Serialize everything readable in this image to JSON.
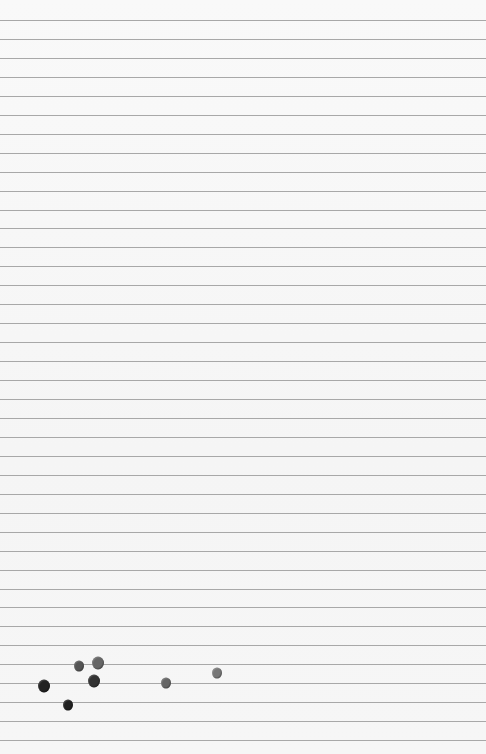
{
  "paper": {
    "width": 486,
    "height": 754,
    "background": "#f7f7f7",
    "line_color": "#9a9a9a",
    "first_line_y": 20,
    "line_spacing": 18.95,
    "line_count": 39
  },
  "dots": [
    {
      "x": 79,
      "y": 666,
      "r": 5,
      "color": "#555555"
    },
    {
      "x": 98,
      "y": 663,
      "r": 6,
      "color": "#666666"
    },
    {
      "x": 44,
      "y": 686,
      "r": 6,
      "color": "#222222"
    },
    {
      "x": 94,
      "y": 681,
      "r": 6,
      "color": "#333333"
    },
    {
      "x": 68,
      "y": 705,
      "r": 5,
      "color": "#222222"
    },
    {
      "x": 166,
      "y": 683,
      "r": 5,
      "color": "#666666"
    },
    {
      "x": 217,
      "y": 673,
      "r": 5,
      "color": "#777777"
    }
  ]
}
